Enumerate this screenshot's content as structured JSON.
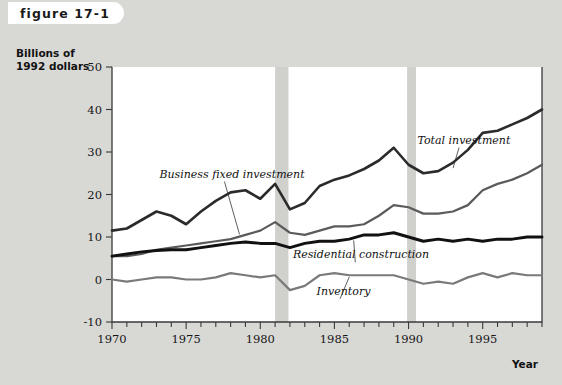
{
  "figure": {
    "tab_label": "figure 17-1"
  },
  "axis": {
    "y_title": "Billions of\n1992 dollars",
    "x_title": "Year",
    "y_ticks": [
      50,
      40,
      30,
      20,
      10,
      0,
      -10
    ],
    "x_ticks": [
      1970,
      1975,
      1980,
      1985,
      1990,
      1995
    ]
  },
  "colors": {
    "total_investment": "#2b2b2b",
    "business_fixed_investment": "#5b5b5b",
    "residential_construction": "#111111",
    "inventory": "#7a7a7a",
    "recession_band": "#d0d0cd",
    "plot_background": "#ffffff",
    "page_background": "#d8d8d5"
  },
  "chart_data": {
    "type": "line",
    "title": "figure 17-1",
    "xlabel": "Year",
    "ylabel": "Billions of 1992 dollars",
    "xlim": [
      1970,
      1999
    ],
    "ylim": [
      -10,
      50
    ],
    "grid": false,
    "legend": "inline-annotations",
    "x": [
      1970,
      1971,
      1972,
      1973,
      1974,
      1975,
      1976,
      1977,
      1978,
      1979,
      1980,
      1981,
      1982,
      1983,
      1984,
      1985,
      1986,
      1987,
      1988,
      1989,
      1990,
      1991,
      1992,
      1993,
      1994,
      1995,
      1996,
      1997,
      1998,
      1999
    ],
    "series": [
      {
        "name": "Total investment",
        "color": "#2b2b2b",
        "values": [
          11.5,
          12.0,
          14.0,
          16.0,
          15.0,
          13.0,
          16.0,
          18.5,
          20.5,
          21.0,
          19.0,
          22.5,
          16.5,
          18.0,
          22.0,
          23.5,
          24.5,
          26.0,
          28.0,
          31.0,
          27.0,
          25.0,
          25.5,
          27.5,
          30.5,
          34.5,
          35.0,
          36.5,
          38.0,
          40.0
        ]
      },
      {
        "name": "Business fixed investment",
        "color": "#5b5b5b",
        "values": [
          5.5,
          5.5,
          6.0,
          7.0,
          7.5,
          8.0,
          8.5,
          9.0,
          9.5,
          10.5,
          11.5,
          13.5,
          11.0,
          10.5,
          11.5,
          12.5,
          12.5,
          13.0,
          15.0,
          17.5,
          17.0,
          15.5,
          15.5,
          16.0,
          17.5,
          21.0,
          22.5,
          23.5,
          25.0,
          27.0
        ]
      },
      {
        "name": "Residential construction",
        "color": "#111111",
        "values": [
          5.5,
          6.0,
          6.5,
          6.8,
          7.0,
          7.0,
          7.5,
          8.0,
          8.5,
          8.8,
          8.5,
          8.5,
          7.5,
          8.5,
          9.0,
          9.0,
          9.5,
          10.5,
          10.5,
          11.0,
          10.0,
          9.0,
          9.5,
          9.0,
          9.5,
          9.0,
          9.5,
          9.5,
          10.0,
          10.0
        ]
      },
      {
        "name": "Inventory",
        "color": "#7a7a7a",
        "values": [
          0.0,
          -0.5,
          0.0,
          0.5,
          0.5,
          0.0,
          0.0,
          0.5,
          1.5,
          1.0,
          0.5,
          1.0,
          -2.5,
          -1.5,
          1.0,
          1.5,
          1.0,
          1.0,
          1.0,
          1.0,
          0.0,
          -1.0,
          -0.5,
          -1.0,
          0.5,
          1.5,
          0.5,
          1.5,
          1.0,
          1.0
        ]
      }
    ],
    "annotations": [
      {
        "text": "Business fixed investment",
        "x": 1973.2,
        "y": 24.0
      },
      {
        "text": "Total investment",
        "x": 1990.6,
        "y": 32.0
      },
      {
        "text": "Residential construction",
        "x": 1982.2,
        "y": 5.0
      },
      {
        "text": "Inventory",
        "x": 1983.8,
        "y": -3.6
      }
    ],
    "recession_bands": [
      {
        "start": 1981.0,
        "end": 1981.9
      },
      {
        "start": 1989.9,
        "end": 1990.5
      }
    ]
  }
}
